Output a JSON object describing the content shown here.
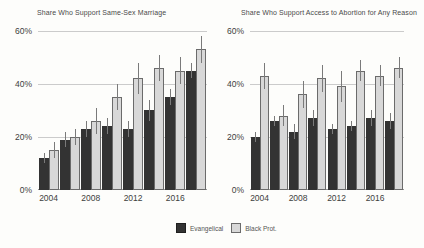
{
  "page": {
    "background": "#fdfdfb"
  },
  "legend": {
    "position": "bottom-center",
    "items": [
      {
        "label": "Evangelical",
        "color": "#333333",
        "border": "#1f1f1f"
      },
      {
        "label": "Black Prot.",
        "color": "#d8d8d8",
        "border": "#6b6b6b"
      }
    ]
  },
  "chart_data": [
    {
      "type": "bar",
      "title": "Share Who Support Same-Sex Marriage",
      "categories": [
        2004,
        2006,
        2008,
        2010,
        2012,
        2014,
        2016,
        2018
      ],
      "x_tick_labels": [
        "2004",
        "2008",
        "2012",
        "2016"
      ],
      "x_tick_groups": [
        0,
        2,
        4,
        6
      ],
      "yticks": [
        0,
        20,
        40,
        60
      ],
      "y_tick_labels": [
        "0%",
        "20%",
        "40%",
        "60%"
      ],
      "ylim": [
        0,
        62.5
      ],
      "grid": true,
      "ylabel": "",
      "xlabel": "",
      "series": [
        {
          "name": "Evangelical",
          "color": "#333333",
          "values": [
            12,
            19,
            23,
            24,
            23,
            30,
            35,
            45
          ],
          "errors": [
            2,
            3,
            3,
            3,
            3,
            4,
            3,
            3
          ]
        },
        {
          "name": "Black Prot.",
          "color": "#d8d8d8",
          "values": [
            15,
            20,
            26,
            35,
            42,
            46,
            45,
            53
          ],
          "errors": [
            3,
            3,
            5,
            5,
            6,
            5,
            5,
            5
          ]
        }
      ]
    },
    {
      "type": "bar",
      "title": "Share Who Support Access to Abortion for Any Reason",
      "categories": [
        2004,
        2006,
        2008,
        2010,
        2012,
        2014,
        2016,
        2018
      ],
      "x_tick_labels": [
        "2004",
        "2008",
        "2012",
        "2016"
      ],
      "x_tick_groups": [
        0,
        2,
        4,
        6
      ],
      "yticks": [
        0,
        20,
        40,
        60
      ],
      "y_tick_labels": [
        "0%",
        "20%",
        "40%",
        "60%"
      ],
      "ylim": [
        0,
        62.5
      ],
      "grid": true,
      "ylabel": "",
      "xlabel": "",
      "series": [
        {
          "name": "Evangelical",
          "color": "#333333",
          "values": [
            20,
            26,
            22,
            27,
            23,
            24,
            27,
            26
          ],
          "errors": [
            2,
            2,
            3,
            3,
            2,
            2,
            3,
            3
          ]
        },
        {
          "name": "Black Prot.",
          "color": "#d8d8d8",
          "values": [
            43,
            28,
            36,
            42,
            39,
            45,
            43,
            46
          ],
          "errors": [
            5,
            4,
            5,
            5,
            6,
            4,
            4,
            4
          ]
        }
      ]
    }
  ]
}
